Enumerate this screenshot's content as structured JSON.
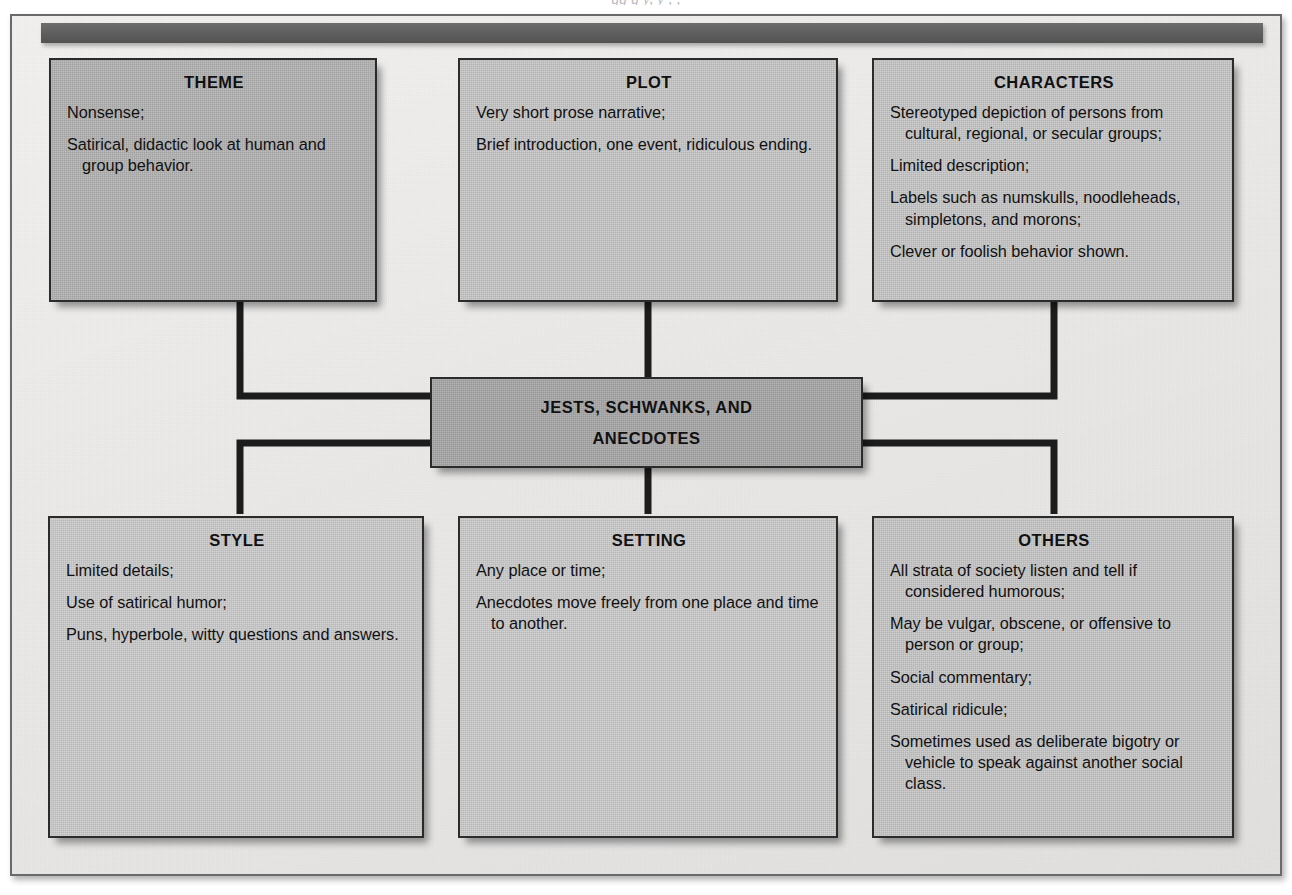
{
  "figure": {
    "top_cut_caption": "gg g y, y , ,",
    "center": {
      "line1": "JESTS, SCHWANKS, AND",
      "line2": "ANECDOTES"
    },
    "nodes": [
      {
        "id": "theme",
        "title": "THEME",
        "items": [
          "Nonsense;",
          "Satirical, didactic look at human and group behavior."
        ]
      },
      {
        "id": "plot",
        "title": "PLOT",
        "items": [
          "Very short prose narrative;",
          "Brief introduction, one event, ridiculous ending."
        ]
      },
      {
        "id": "characters",
        "title": "CHARACTERS",
        "items": [
          "Stereotyped depiction of persons from cultural, regional, or secular groups;",
          "Limited description;",
          "Labels such as numskulls, noodleheads, simpletons, and morons;",
          "Clever or foolish behavior shown."
        ]
      },
      {
        "id": "style",
        "title": "STYLE",
        "items": [
          "Limited details;",
          "Use of satirical humor;",
          "Puns, hyperbole, witty questions and answers."
        ]
      },
      {
        "id": "setting",
        "title": "SETTING",
        "items": [
          "Any place or time;",
          "Anecdotes move freely from one place and time to another."
        ]
      },
      {
        "id": "others",
        "title": "OTHERS",
        "items": [
          "All strata of society listen and tell if considered humorous;",
          "May be vulgar, obscene, or offensive to person or group;",
          "Social commentary;",
          "Satirical ridicule;",
          "Sometimes used as deliberate bigotry or vehicle to speak against another social class."
        ]
      }
    ],
    "colors": {
      "page_background": "#edeceb",
      "frame_border": "#6a6a6a",
      "header_bar": "#5c5c5c",
      "node_fill": "#c8c8c8",
      "node_fill_dark": "#b4b4b4",
      "center_fill": "#a9a9a9",
      "connector": "#1c1c1c",
      "text": "#111111"
    }
  }
}
